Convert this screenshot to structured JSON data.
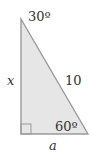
{
  "diagram": {
    "type": "right-triangle",
    "angles": {
      "top": "30º",
      "bottom_right": "60º",
      "bottom_left": "right-angle"
    },
    "sides": {
      "vertical_leg": "x",
      "hypotenuse": "10",
      "horizontal_leg": "a"
    },
    "colors": {
      "fill": "#e6e6e6",
      "stroke": "#9a9a9a",
      "text": "#333333"
    }
  }
}
